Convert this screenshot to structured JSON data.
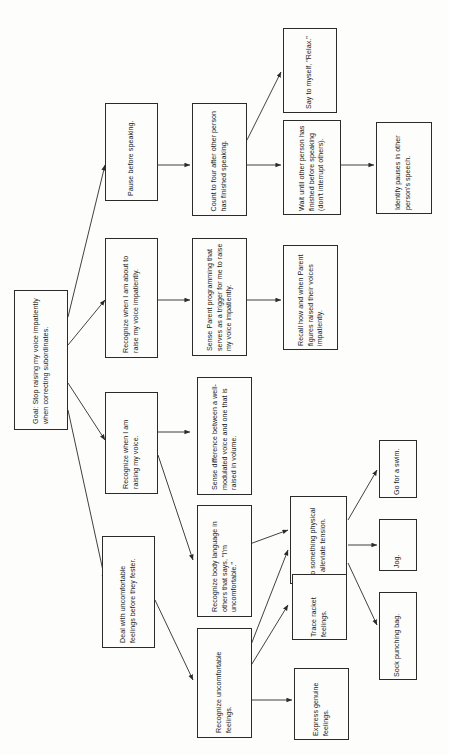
{
  "diagram": {
    "orientation": "rotated-90-ccw",
    "stroke_color": "#2b2b2b",
    "background_color": "#fdfdfb",
    "nodes": [
      {
        "id": "goal",
        "label": "Goal: Stop raising my voice impatiently when correcting subordinates."
      },
      {
        "id": "pause",
        "label": "Pause before speaking."
      },
      {
        "id": "recog_about",
        "label": "Recognize when I am about to raise my voice impatiently."
      },
      {
        "id": "recog_rais",
        "label": "Recognize when I am raising my voice."
      },
      {
        "id": "deal_uncomf",
        "label": "Deal with uncomfortable feelings before they fester."
      },
      {
        "id": "count_four",
        "label": "Count to four after other person has finished speaking."
      },
      {
        "id": "sense_parent",
        "label": "Sense Parent programming that serves as a trigger for me to raise my voice impatiently."
      },
      {
        "id": "sense_diff",
        "label": "Sense difference between a well-modulated voice and one that is raised in volume."
      },
      {
        "id": "recog_body",
        "label": "Recognize body language in others that says, \"I'm uncomfortable.\""
      },
      {
        "id": "recog_uncomf",
        "label": "Recognize uncomfortable feelings."
      },
      {
        "id": "say_relax",
        "label": "Say to myself, \"Relax.\""
      },
      {
        "id": "wait_until",
        "label": "Wait until other person has finished before speaking (don't interrupt others)."
      },
      {
        "id": "recall_how",
        "label": "Recall how and when Parent figures raised their voices impatiently."
      },
      {
        "id": "do_physical",
        "label": "Do something physical to alleviate tension."
      },
      {
        "id": "trace_racket",
        "label": "Trace racket feelings."
      },
      {
        "id": "express_gen",
        "label": "Express genuine feelings."
      },
      {
        "id": "identify_pau",
        "label": "Identify pauses in other person's speech."
      },
      {
        "id": "go_swim",
        "label": "Go for a swim."
      },
      {
        "id": "jog",
        "label": "Jog."
      },
      {
        "id": "sock_bag",
        "label": "Sock punching bag."
      }
    ]
  }
}
